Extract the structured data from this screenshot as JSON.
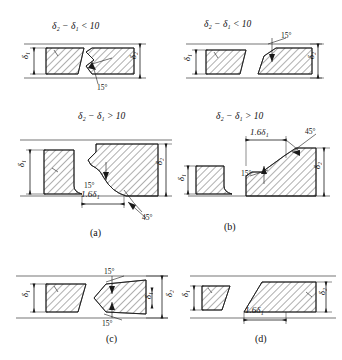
{
  "figure": {
    "title_hidden": "Welding groove preparation for plates of unequal thickness",
    "background_color": "#ffffff",
    "line_color": "#1a1a1a"
  },
  "conditions": {
    "top_left": "δ₂ − δ₁ < 10",
    "top_right": "δ₂ − δ₁ < 10",
    "mid_left": "δ₂ − δ₁ > 10",
    "mid_right": "δ₂ − δ₁ > 10"
  },
  "panels": [
    {
      "key": "a",
      "caption": "(a)",
      "condition": "δ₂ − δ₁ > 10",
      "annotations": [
        "15°",
        "1.6δ₁",
        "45°"
      ],
      "dimensions": [
        "δ₁",
        "δ₂"
      ]
    },
    {
      "key": "b",
      "caption": "(b)",
      "condition": "δ₂ − δ₁ > 10",
      "annotations": [
        "1.6δ₁",
        "45°",
        "15°"
      ],
      "dimensions": [
        "δ₁",
        "δ₂"
      ]
    },
    {
      "key": "c",
      "caption": "(c)",
      "condition": "",
      "annotations": [
        "15°",
        "15°"
      ],
      "dimensions": [
        "δ₁",
        "δ₂"
      ]
    },
    {
      "key": "d",
      "caption": "(d)",
      "condition": "",
      "annotations": [
        "1.6δ₁"
      ],
      "dimensions": [
        "δ₁",
        "δ₂"
      ]
    }
  ],
  "labels": {
    "delta1": "δ₁",
    "delta2": "δ₂",
    "ang15": "15°",
    "ang45": "45°",
    "dim16d1": "1.6δ₁",
    "cap_a": "(a)",
    "cap_b": "(b)",
    "cap_c": "(c)",
    "cap_d": "(d)"
  }
}
